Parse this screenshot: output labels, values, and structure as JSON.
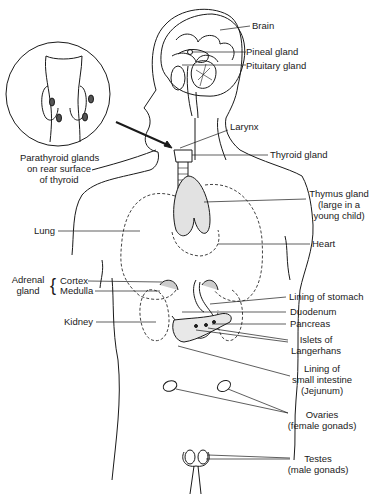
{
  "diagram": {
    "style": "black line drawing on white",
    "colors": {
      "line": "#1a1a1a",
      "background": "#ffffff",
      "dashed_organs": "#444444"
    },
    "inset": {
      "caption_lines": [
        "Parathyroid glands",
        "on rear surface",
        "of thyroid"
      ]
    },
    "labels": {
      "brain": "Brain",
      "pineal": "Pineal  gland",
      "pituitary": "Pituitary gland",
      "larynx": "Larynx",
      "thyroid": "Thyroid gland",
      "thymus": [
        "Thymus gland",
        "(large in a",
        "young child)"
      ],
      "lung": "Lung",
      "heart": "Heart",
      "adrenal": [
        "Adrenal",
        "gland"
      ],
      "cortex": "Cortex",
      "medulla": "Medulla",
      "stomach": "Lining of stomach",
      "duodenum": "Duodenum",
      "kidney": "Kidney",
      "pancreas": "Pancreas",
      "islets": [
        "Islets of",
        "Langerhans"
      ],
      "small_intestine": [
        "Lining of",
        "small intestine",
        "(Jejunum)"
      ],
      "ovaries": [
        "Ovaries",
        "(female gonads)"
      ],
      "testes": [
        "Testes",
        "(male gonads)"
      ]
    }
  }
}
